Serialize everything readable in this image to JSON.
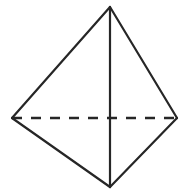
{
  "figure": {
    "canvas": {
      "width": 186,
      "height": 189,
      "background": "#ffffff"
    },
    "style": {
      "stroke_color": "#262626",
      "stroke_width": 2.2,
      "dash_stroke_width": 2.4,
      "dash_pattern": "10 9",
      "fill_color": "none"
    },
    "vertices": [
      {
        "name": "apex",
        "label": "top",
        "x": 110,
        "y": 7
      },
      {
        "name": "left",
        "label": "left",
        "x": 12,
        "y": 118
      },
      {
        "name": "right",
        "label": "right",
        "x": 177,
        "y": 118
      },
      {
        "name": "bottom",
        "label": "bottom",
        "x": 110,
        "y": 187
      }
    ],
    "edges": [
      {
        "name": "edge-apex-left",
        "from": "apex",
        "to": "left",
        "style": "solid"
      },
      {
        "name": "edge-apex-right",
        "from": "apex",
        "to": "right",
        "style": "solid"
      },
      {
        "name": "edge-left-bottom",
        "from": "left",
        "to": "bottom",
        "style": "solid"
      },
      {
        "name": "edge-right-bottom",
        "from": "right",
        "to": "bottom",
        "style": "solid"
      },
      {
        "name": "edge-apex-bottom",
        "from": "apex",
        "to": "bottom",
        "style": "solid"
      },
      {
        "name": "edge-left-right",
        "from": "left",
        "to": "right",
        "style": "dashed"
      }
    ],
    "outline_points": "110,7 177,118 110,187 12,118"
  }
}
